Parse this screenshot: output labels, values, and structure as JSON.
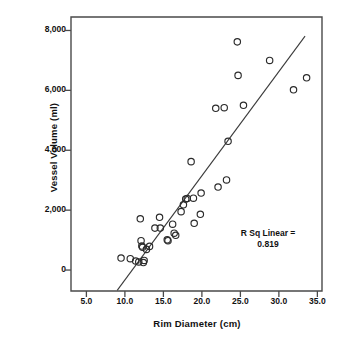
{
  "chart_data": {
    "type": "scatter",
    "title": "",
    "xlabel": "Rim Diameter (cm)",
    "ylabel": "Vessel Volume (ml)",
    "xlim": [
      3.0,
      35.6
    ],
    "ylim": [
      -700,
      8450
    ],
    "xticks": [
      "5.0",
      "10.0",
      "15.0",
      "20.0",
      "25.0",
      "30.0",
      "35.0"
    ],
    "xtick_values": [
      5.0,
      10.0,
      15.0,
      20.0,
      25.0,
      30.0,
      35.0
    ],
    "yticks": [
      "0",
      "2,000",
      "4,000",
      "6,000",
      "8,000"
    ],
    "ytick_values": [
      0,
      2000,
      4000,
      6000,
      8000
    ],
    "grid": false,
    "legend": null,
    "marker": "open-circle",
    "marker_color": "#2b2b2b",
    "points": [
      [
        9.5,
        400
      ],
      [
        10.7,
        380
      ],
      [
        11.4,
        300
      ],
      [
        11.8,
        270
      ],
      [
        12.0,
        1710
      ],
      [
        12.1,
        980
      ],
      [
        12.2,
        800
      ],
      [
        12.3,
        760
      ],
      [
        12.4,
        250
      ],
      [
        12.5,
        320
      ],
      [
        12.8,
        690
      ],
      [
        13.2,
        790
      ],
      [
        13.9,
        1400
      ],
      [
        14.5,
        1760
      ],
      [
        14.6,
        1400
      ],
      [
        15.5,
        1010
      ],
      [
        15.6,
        980
      ],
      [
        16.2,
        1530
      ],
      [
        16.4,
        1230
      ],
      [
        16.6,
        1160
      ],
      [
        17.3,
        1950
      ],
      [
        17.6,
        2180
      ],
      [
        17.9,
        2370
      ],
      [
        18.1,
        2390
      ],
      [
        18.6,
        3620
      ],
      [
        18.9,
        2400
      ],
      [
        19.0,
        1560
      ],
      [
        19.8,
        1860
      ],
      [
        19.9,
        2570
      ],
      [
        21.8,
        5400
      ],
      [
        22.1,
        2770
      ],
      [
        22.9,
        5420
      ],
      [
        23.2,
        3010
      ],
      [
        23.4,
        4300
      ],
      [
        24.6,
        7620
      ],
      [
        24.7,
        6500
      ],
      [
        25.4,
        5500
      ],
      [
        28.8,
        7000
      ],
      [
        31.9,
        6020
      ],
      [
        33.6,
        6420
      ]
    ],
    "fit_line": {
      "type": "linear",
      "x_start": 9.0,
      "y_start": -680,
      "x_end": 33.4,
      "y_end": 7810
    },
    "annotations": [
      {
        "name": "r-squared",
        "text": "R Sq Linear =\n0.819",
        "value": 0.819,
        "label": "R Sq Linear ="
      }
    ]
  }
}
